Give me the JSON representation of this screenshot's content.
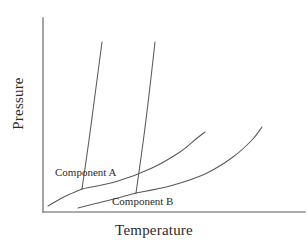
{
  "figure": {
    "kind": "phase-diagram",
    "background_color": "#ffffff",
    "axis_color": "#8e8e8e",
    "curve_color": "#5a5a5a",
    "text_color": "#2b2b2b"
  },
  "axes": {
    "x_title": "Temperature",
    "y_title": "Pressure"
  },
  "labels": {
    "component_a": "Component A",
    "component_b": "Component B"
  },
  "chart_data": {
    "type": "line",
    "title": "",
    "subtitle": "",
    "xlabel": "Temperature",
    "ylabel": "Pressure",
    "xlim": [
      0,
      1
    ],
    "ylim": [
      0,
      1
    ],
    "grid": false,
    "ticks": {
      "x": [],
      "y": []
    },
    "legend": {
      "position": "inline-annotations",
      "entries": [
        "Component A",
        "Component B"
      ]
    },
    "annotations": [
      {
        "text": "Component A",
        "x_px": 55,
        "y_px": 167,
        "describes": "Component A phase boundaries"
      },
      {
        "text": "Component B",
        "x_px": 112,
        "y_px": 196,
        "describes": "Component B phase boundaries"
      }
    ],
    "axis_geometry_px": {
      "y_axis": {
        "x": 43,
        "y_top": 18,
        "y_bottom": 212
      },
      "x_axis": {
        "y": 212,
        "x_left": 43,
        "x_right": 305
      }
    },
    "series": [
      {
        "name": "Component A - sublimation",
        "component": "Component A",
        "boundary": "solid-gas",
        "points_px": [
          [
            48,
            206
          ],
          [
            60,
            199
          ],
          [
            70,
            194
          ],
          [
            82,
            189
          ]
        ]
      },
      {
        "name": "Component A - fusion",
        "component": "Component A",
        "boundary": "solid-liquid",
        "points_px": [
          [
            82,
            189
          ],
          [
            89,
            140
          ],
          [
            95,
            95
          ],
          [
            102,
            42
          ]
        ]
      },
      {
        "name": "Component A - vaporization",
        "component": "Component A",
        "boundary": "liquid-gas",
        "points_px": [
          [
            82,
            189
          ],
          [
            118,
            181
          ],
          [
            152,
            168
          ],
          [
            180,
            152
          ],
          [
            196,
            139
          ],
          [
            205,
            132
          ]
        ]
      },
      {
        "name": "Component B - sublimation",
        "component": "Component B",
        "boundary": "solid-gas",
        "points_px": [
          [
            78,
            208
          ],
          [
            98,
            203
          ],
          [
            118,
            198
          ],
          [
            136,
            193
          ]
        ]
      },
      {
        "name": "Component B - fusion",
        "component": "Component B",
        "boundary": "solid-liquid",
        "points_px": [
          [
            136,
            193
          ],
          [
            143,
            143
          ],
          [
            149,
            95
          ],
          [
            155,
            42
          ]
        ]
      },
      {
        "name": "Component B - vaporization",
        "component": "Component B",
        "boundary": "liquid-gas",
        "points_px": [
          [
            136,
            193
          ],
          [
            170,
            186
          ],
          [
            205,
            174
          ],
          [
            233,
            157
          ],
          [
            252,
            140
          ],
          [
            262,
            127
          ]
        ]
      }
    ],
    "triple_points_px": [
      {
        "component": "Component A",
        "x": 82,
        "y": 189
      },
      {
        "component": "Component B",
        "x": 136,
        "y": 193
      }
    ]
  }
}
